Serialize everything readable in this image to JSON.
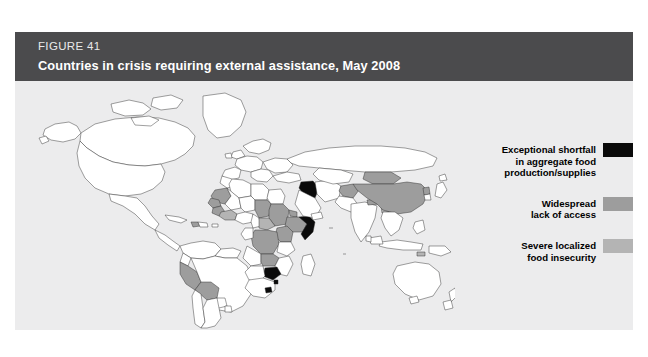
{
  "figure": {
    "number": "FIGURE 41",
    "title": "Countries in crisis requiring external assistance, May 2008"
  },
  "colors": {
    "header_bg": "#4b4b4d",
    "panel_bg": "#ececed",
    "exceptional_shortfall": "#0a0a0a",
    "widespread_lack_of_access": "#9d9d9d",
    "severe_localized_food_insecurity": "#b4b4b4",
    "country_default": "#ffffff",
    "country_outline": "#2a2a2a"
  },
  "legend": {
    "items": [
      {
        "swatch": "#0a0a0a",
        "lines": [
          "Exceptional shortfall",
          "in aggregate food",
          "production/supplies"
        ]
      },
      {
        "swatch": "#9d9d9d",
        "lines": [
          "Widespread",
          "lack of access"
        ]
      },
      {
        "swatch": "#b4b4b4",
        "lines": [
          "Severe localized",
          "food insecurity"
        ]
      }
    ]
  },
  "map": {
    "type": "choropleth-world",
    "categories": [
      "Exceptional shortfall in aggregate food production/supplies",
      "Widespread lack of access",
      "Severe localized food insecurity"
    ],
    "countries_exceptional_shortfall": [
      "Iraq",
      "Somalia",
      "Zimbabwe",
      "Lesotho",
      "Swaziland"
    ],
    "countries_widespread_lack_of_access": [
      "Chad",
      "Sudan",
      "Eritrea",
      "Ethiopia",
      "Kenya",
      "Democratic Republic of the Congo",
      "Zambia",
      "Mauritania",
      "Sierra Leone",
      "Liberia",
      "Guinea",
      "China",
      "Afghanistan",
      "Nepal",
      "Korea DPR",
      "Mongolia",
      "Haiti",
      "Bolivia",
      "Peru"
    ],
    "countries_severe_localized": [
      "Central African Republic",
      "Uganda",
      "Burundi",
      "Côte d'Ivoire",
      "Timor-Leste",
      "Bangladesh"
    ],
    "unshaded_note": "All remaining countries rendered white with dark outlines"
  }
}
